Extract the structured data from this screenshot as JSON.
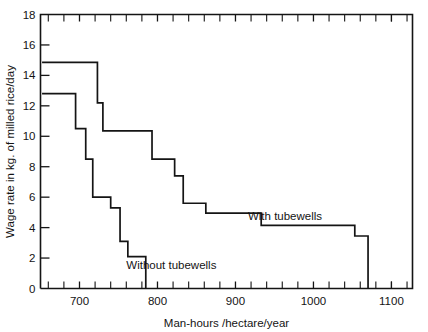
{
  "chart_data": {
    "type": "line",
    "subtype": "step",
    "title": "",
    "xlabel": "Man-hours /hectare/year",
    "ylabel": "Wage rate in kg. of milled rice/day",
    "xlim": [
      650,
      1127
    ],
    "ylim": [
      0,
      18
    ],
    "xticks_major": [
      700,
      800,
      900,
      1000,
      1100
    ],
    "xticks_minor": [
      660,
      680,
      720,
      740,
      760,
      780,
      820,
      840,
      860,
      880,
      920,
      940,
      960,
      980,
      1020,
      1040,
      1060,
      1080,
      1100,
      1120
    ],
    "xtick_labels": [
      "700",
      "800",
      "900",
      "1000",
      "1100"
    ],
    "yticks": [
      0,
      2,
      4,
      6,
      8,
      10,
      12,
      14,
      16,
      18
    ],
    "ytick_labels": [
      "0",
      "2",
      "4",
      "6",
      "8",
      "10",
      "12",
      "14",
      "16",
      "18"
    ],
    "grid": false,
    "legend_position": "inline-annotations",
    "series": [
      {
        "name": "Without tubewells",
        "label": "Without tubewells",
        "color": "#141414",
        "annotation_x": 760,
        "annotation_y": 1.55,
        "steps": [
          {
            "x": 652,
            "y": 12.8
          },
          {
            "x": 695,
            "y": 12.8
          },
          {
            "x": 695,
            "y": 10.5
          },
          {
            "x": 708,
            "y": 10.5
          },
          {
            "x": 708,
            "y": 8.5
          },
          {
            "x": 717,
            "y": 8.5
          },
          {
            "x": 717,
            "y": 6.0
          },
          {
            "x": 740,
            "y": 6.0
          },
          {
            "x": 740,
            "y": 5.3
          },
          {
            "x": 752,
            "y": 5.3
          },
          {
            "x": 752,
            "y": 3.1
          },
          {
            "x": 762,
            "y": 3.1
          },
          {
            "x": 762,
            "y": 2.1
          },
          {
            "x": 785,
            "y": 2.1
          },
          {
            "x": 785,
            "y": 0.0
          }
        ]
      },
      {
        "name": "With tubewells",
        "label": "With tubewells",
        "color": "#141414",
        "annotation_x": 916,
        "annotation_y": 4.75,
        "steps": [
          {
            "x": 652,
            "y": 14.85
          },
          {
            "x": 723,
            "y": 14.85
          },
          {
            "x": 723,
            "y": 12.2
          },
          {
            "x": 730,
            "y": 12.2
          },
          {
            "x": 730,
            "y": 10.35
          },
          {
            "x": 793,
            "y": 10.35
          },
          {
            "x": 793,
            "y": 8.5
          },
          {
            "x": 822,
            "y": 8.5
          },
          {
            "x": 822,
            "y": 7.4
          },
          {
            "x": 833,
            "y": 7.4
          },
          {
            "x": 833,
            "y": 5.6
          },
          {
            "x": 862,
            "y": 5.6
          },
          {
            "x": 862,
            "y": 4.95
          },
          {
            "x": 933,
            "y": 4.95
          },
          {
            "x": 933,
            "y": 4.15
          },
          {
            "x": 1053,
            "y": 4.15
          },
          {
            "x": 1053,
            "y": 3.45
          },
          {
            "x": 1070,
            "y": 3.45
          },
          {
            "x": 1070,
            "y": 0.0
          }
        ]
      }
    ]
  }
}
